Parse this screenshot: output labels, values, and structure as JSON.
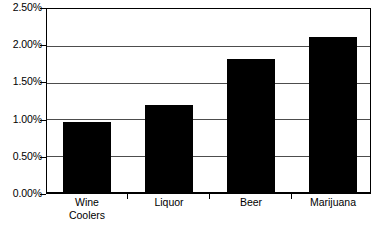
{
  "chart_data": {
    "type": "bar",
    "title": "",
    "subtitle": "",
    "xlabel": "",
    "ylabel": "",
    "categories": [
      "Wine Coolers",
      "Liquor",
      "Beer",
      "Marijuana"
    ],
    "category_lines": [
      [
        "Wine",
        "Coolers"
      ],
      [
        "Liquor"
      ],
      [
        "Beer"
      ],
      [
        "Marijuana"
      ]
    ],
    "values": [
      0.96,
      1.2,
      1.82,
      2.12
    ],
    "value_labels": [
      "0.96%",
      "1.20%",
      "1.82%",
      "2.12%"
    ],
    "ylim": [
      0,
      2.5
    ],
    "ytick_values": [
      0.0,
      0.5,
      1.0,
      1.5,
      2.0,
      2.5
    ],
    "ytick_labels": [
      "0.00%",
      "0.50%",
      "1.00%",
      "1.50%",
      "2.00%",
      "2.50%"
    ],
    "grid": true,
    "grid_axis": "y",
    "legend": false,
    "legend_position": "none",
    "bar_color": "#000000",
    "grid_color": "#4d4d4d",
    "axis_color": "#000000",
    "plot_background": "#ffffff",
    "units": "percent"
  }
}
